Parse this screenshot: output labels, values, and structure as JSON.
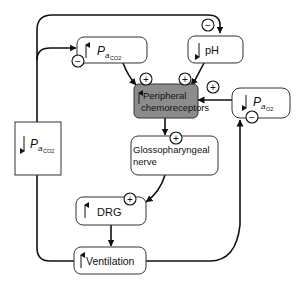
{
  "diagram": {
    "type": "physiological feedback loop",
    "nodes": {
      "paco2_up": {
        "arrow": "up",
        "label": "P",
        "subscript": "a",
        "subsub": "CO2"
      },
      "ph": {
        "arrow": "down",
        "label": "pH"
      },
      "chemoreceptors": {
        "arrow": "up",
        "line1": "Peripheral",
        "line2": "chemoreceptors"
      },
      "pao2": {
        "arrow": "down",
        "label": "P",
        "subscript": "a",
        "subsub": "O2"
      },
      "paco2_down": {
        "arrow": "down",
        "label": "P",
        "subscript": "a",
        "subsub": "CO2"
      },
      "glosso": {
        "line1": "Glossopharyngeal",
        "line2": "nerve"
      },
      "drg": {
        "arrow": "up",
        "label": "DRG"
      },
      "ventilation": {
        "arrow": "up",
        "label": "Ventilation"
      }
    },
    "signs": {
      "paco2_inhibit": "−",
      "ph_inhibit": "−",
      "pao2_inhibit": "−",
      "chemo_from_paco2": "+",
      "chemo_from_ph": "+",
      "chemo_from_pao2": "+",
      "glosso_from_chemo": "+",
      "drg_from_glosso": "+"
    },
    "edges": [
      {
        "from": "paco2_down",
        "to": "paco2_up",
        "sign": "−"
      },
      {
        "from": "paco2_down",
        "to": "ph",
        "sign": "−"
      },
      {
        "from": "paco2_up",
        "to": "chemoreceptors",
        "sign": "+"
      },
      {
        "from": "ph",
        "to": "chemoreceptors",
        "sign": "+"
      },
      {
        "from": "pao2",
        "to": "chemoreceptors",
        "sign": "+"
      },
      {
        "from": "chemoreceptors",
        "to": "glosso",
        "sign": "+"
      },
      {
        "from": "glosso",
        "to": "drg",
        "sign": "+"
      },
      {
        "from": "drg",
        "to": "ventilation"
      },
      {
        "from": "ventilation",
        "to": "paco2_down"
      },
      {
        "from": "ventilation",
        "to": "pao2",
        "sign": "−"
      }
    ]
  }
}
